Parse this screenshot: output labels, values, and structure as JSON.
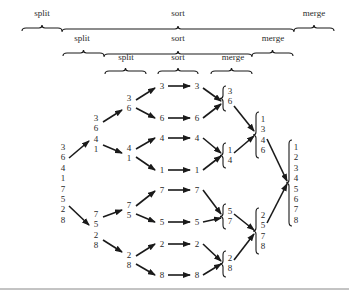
{
  "figure": {
    "braces": [
      {
        "level": 1,
        "labels": [
          {
            "text": "split",
            "x": 42,
            "y": 14,
            "x1": 22,
            "x2": 62
          },
          {
            "text": "sort",
            "x": 178,
            "y": 14,
            "x1": 62,
            "x2": 294
          },
          {
            "text": "merge",
            "x": 314,
            "y": 14,
            "x1": 294,
            "x2": 334
          }
        ]
      },
      {
        "level": 2,
        "labels": [
          {
            "text": "split",
            "x": 82,
            "y": 39,
            "x1": 63,
            "x2": 104
          },
          {
            "text": "sort",
            "x": 178,
            "y": 39,
            "x1": 104,
            "x2": 252
          },
          {
            "text": "merge",
            "x": 273,
            "y": 39,
            "x1": 252,
            "x2": 293
          }
        ]
      },
      {
        "level": 3,
        "labels": [
          {
            "text": "split",
            "x": 126,
            "y": 58,
            "x1": 105,
            "x2": 146
          },
          {
            "text": "sort",
            "x": 178,
            "y": 58,
            "x1": 158,
            "x2": 198
          },
          {
            "text": "merge",
            "x": 233,
            "y": 58,
            "x1": 211,
            "x2": 252
          }
        ]
      }
    ],
    "input": [
      "3",
      "6",
      "4",
      "1",
      "7",
      "5",
      "2",
      "8"
    ],
    "split1": {
      "top": [
        "3",
        "6",
        "4",
        "1"
      ],
      "bottom": [
        "7",
        "5",
        "2",
        "8"
      ]
    },
    "split2": {
      "a": [
        "3",
        "6"
      ],
      "b": [
        "4",
        "1"
      ],
      "c": [
        "7",
        "5"
      ],
      "d": [
        "2",
        "8"
      ]
    },
    "singles_left": [
      "3",
      "6",
      "4",
      "1",
      "7",
      "5",
      "2",
      "8"
    ],
    "singles_right": [
      "3",
      "6",
      "4",
      "1",
      "7",
      "5",
      "2",
      "8"
    ],
    "merge1": {
      "a": [
        "3",
        "6"
      ],
      "b": [
        "1",
        "4"
      ],
      "c": [
        "5",
        "7"
      ],
      "d": [
        "2",
        "8"
      ]
    },
    "merge2": {
      "top": [
        "1",
        "3",
        "4",
        "6"
      ],
      "bottom": [
        "2",
        "5",
        "7",
        "8"
      ]
    },
    "output": [
      "1",
      "2",
      "3",
      "4",
      "5",
      "6",
      "7",
      "8"
    ],
    "stroke_color": "#1a1a1a"
  }
}
